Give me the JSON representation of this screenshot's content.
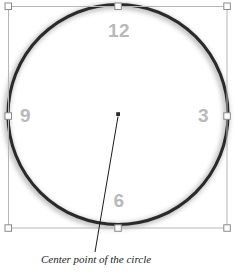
{
  "figure": {
    "type": "vector-shape-editor-illustration",
    "canvas": {
      "width": 238,
      "height": 275,
      "background": "#ffffff"
    },
    "caption": "Center point of the circle",
    "colors": {
      "circle_stroke": "#2b2b2b",
      "circle_shadow": "#bcbcbc",
      "clock_label": "#b9b9b9",
      "selection_line": "#b5b5b5",
      "handle_fill": "#ffffff",
      "handle_stroke": "#8a8a8a",
      "center_point": "#2b2b2b",
      "leader_line": "#1b1b1b",
      "caption_text": "#1b1b1b"
    }
  },
  "shape": {
    "name": "circle",
    "center": {
      "x": 118,
      "y": 114
    },
    "radius": 110,
    "stroke_width": 3
  },
  "selection": {
    "bounds": {
      "left": 8,
      "top": 6,
      "right": 227,
      "bottom": 228
    },
    "handles": [
      {
        "name": "handle-top-left",
        "x": 8,
        "y": 6
      },
      {
        "name": "handle-top-center",
        "x": 118,
        "y": 6
      },
      {
        "name": "handle-top-right",
        "x": 227,
        "y": 6
      },
      {
        "name": "handle-middle-left",
        "x": 8,
        "y": 116
      },
      {
        "name": "handle-middle-right",
        "x": 227,
        "y": 116
      },
      {
        "name": "handle-bottom-left",
        "x": 8,
        "y": 228
      },
      {
        "name": "handle-bottom-center",
        "x": 118,
        "y": 228
      },
      {
        "name": "handle-bottom-right",
        "x": 227,
        "y": 228
      }
    ]
  },
  "clock_labels": {
    "twelve": "12",
    "three": "3",
    "six": "6",
    "nine": "9"
  },
  "annotation": {
    "label": "Center point of the circle",
    "leader_line": {
      "x1": 118,
      "y1": 116,
      "x2": 95,
      "y2": 252
    },
    "target_point": {
      "x": 118,
      "y": 114
    }
  }
}
